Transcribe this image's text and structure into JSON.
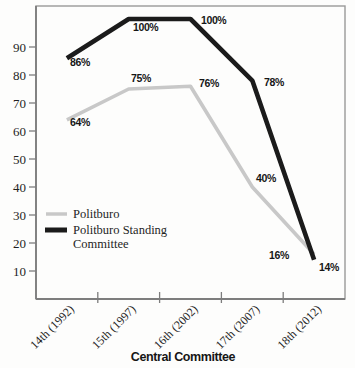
{
  "figure": {
    "background": "#fdfdfc",
    "frame_color": "#999999",
    "axis_color": "#7d7d7d",
    "text_color": "#1f1f1f"
  },
  "chart_data": {
    "type": "line",
    "title": "",
    "xlabel": "Central Committee",
    "ylabel": "",
    "ylim": [
      0,
      100
    ],
    "yticks": [
      10,
      20,
      30,
      40,
      50,
      60,
      70,
      80,
      90
    ],
    "grid": false,
    "categories": [
      "14th (1992)",
      "15th (1997)",
      "16th (2002)",
      "17th (2007)",
      "18th (2012)"
    ],
    "series": [
      {
        "name": "Politburo",
        "values": [
          64,
          75,
          76,
          40,
          16
        ],
        "point_labels": [
          "64%",
          "75%",
          "76%",
          "40%",
          "16%"
        ],
        "color": "#c8c8c8",
        "stroke_width": 3.6,
        "label_pos": [
          [
            70,
            126
          ],
          [
            131,
            82
          ],
          [
            199,
            87
          ],
          [
            256,
            182
          ],
          [
            269,
            259
          ]
        ]
      },
      {
        "name": "Politburo Standing Committee",
        "values": [
          86,
          100,
          100,
          78,
          14
        ],
        "point_labels": [
          "86%",
          "100%",
          "100%",
          "78%",
          "14%"
        ],
        "color": "#1b1b1b",
        "stroke_width": 4.6,
        "label_pos": [
          [
            70,
            66
          ],
          [
            133,
            31
          ],
          [
            201,
            24
          ],
          [
            264,
            86
          ],
          [
            319,
            271
          ]
        ]
      }
    ],
    "legend_position": "inside-left",
    "legend": [
      {
        "lines": [
          "Politburo"
        ],
        "color": "#c8c8c8",
        "swatch_width": 3.5
      },
      {
        "lines": [
          "Politburo Standing",
          "Committee"
        ],
        "color": "#1b1b1b",
        "swatch_width": 5
      }
    ]
  }
}
